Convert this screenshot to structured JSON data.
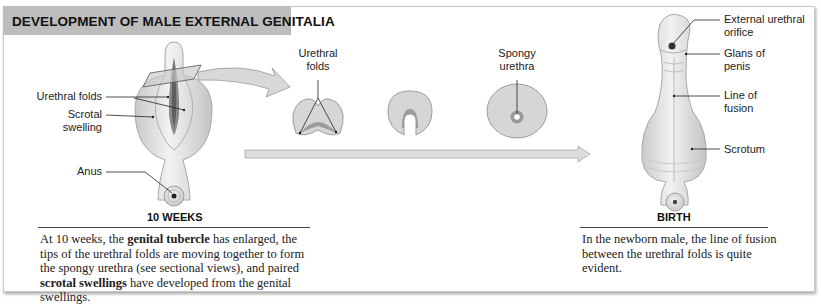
{
  "title": "DEVELOPMENT OF MALE EXTERNAL GENITALIA",
  "stage_10_weeks": {
    "label": "10 WEEKS",
    "annotations": {
      "urethral_folds": "Urethral folds",
      "scrotal_swelling_1": "Scrotal",
      "scrotal_swelling_2": "swelling",
      "anus": "Anus"
    },
    "caption": {
      "t1": "At 10 weeks, the ",
      "b1": "genital tubercle",
      "t2": " has enlarged, the tips of the urethral folds are moving together to form the spongy urethra (see sectional views), and paired ",
      "b2": "scrotal swellings",
      "t3": " have developed from the genital swellings."
    }
  },
  "sectional_views": {
    "urethral_folds_1": "Urethral",
    "urethral_folds_2": "folds",
    "spongy_urethra_1": "Spongy",
    "spongy_urethra_2": "urethra"
  },
  "stage_birth": {
    "label": "BIRTH",
    "annotations": {
      "external_urethral_orifice_1": "External urethral",
      "external_urethral_orifice_2": "orifice",
      "glans_1": "Glans of",
      "glans_2": "penis",
      "line_of_fusion_1": "Line of",
      "line_of_fusion_2": "fusion",
      "scrotum": "Scrotum"
    },
    "caption": "In the newborn male, the line of fusion between the urethral folds is quite evident."
  },
  "colors": {
    "title_bar": "#bdbdbd",
    "tissue": "#e4e4e4",
    "tissue_edge": "#a8a8a8",
    "shade": "#9a9a9a",
    "arrow": "#d6d6d6"
  }
}
